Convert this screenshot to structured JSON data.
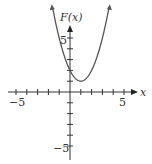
{
  "chart_data": {
    "type": "line",
    "title": "",
    "xlabel": "x",
    "ylabel": "F(x)",
    "xlim": [
      -5.5,
      5.8
    ],
    "ylim": [
      -5.5,
      6.5
    ],
    "x_ticks": [
      -5,
      -4,
      -3,
      -2,
      -1,
      0,
      1,
      2,
      3,
      4,
      5
    ],
    "y_ticks": [
      -5,
      -4,
      -3,
      -2,
      -1,
      0,
      1,
      2,
      3,
      4,
      5
    ],
    "x_tick_labels": [
      "-5",
      "5"
    ],
    "y_tick_labels": [
      "5",
      "-5"
    ],
    "grid": false,
    "series": [
      {
        "name": "F(x) = (x-1)^2 + 1",
        "x": [
          -1.6,
          -1,
          -0.5,
          0,
          0.5,
          1,
          1.5,
          2,
          2.5,
          3,
          3.6
        ],
        "y": [
          7.76,
          5,
          3.25,
          2,
          1.25,
          1,
          1.25,
          2,
          3.25,
          5,
          7.76
        ]
      }
    ],
    "color": "#555555"
  },
  "labels": {
    "y_axis": "F(x)",
    "x_axis": "x",
    "x_neg": "−5",
    "x_pos": "5",
    "y_pos": "5",
    "y_neg": "−5"
  }
}
